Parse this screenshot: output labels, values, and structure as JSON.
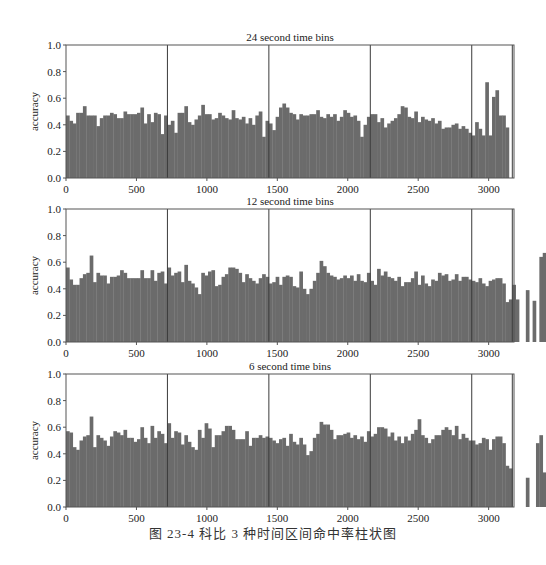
{
  "figure": {
    "caption": "图 23-4   科比 3 种时间区间命中率柱状图"
  },
  "style": {
    "bar_color": "#6b6b6b",
    "axis_color": "#555555",
    "vline_color": "#3a3a3a",
    "background": "#ffffff"
  },
  "chart_data": [
    {
      "type": "bar",
      "title": "24 second time bins",
      "xlabel": "",
      "ylabel": "accuracy",
      "xlim": [
        0,
        3180
      ],
      "ylim": [
        0.0,
        1.0
      ],
      "xticks": [
        0,
        500,
        1000,
        1500,
        2000,
        2500,
        3000
      ],
      "yticks": [
        0.0,
        0.2,
        0.4,
        0.6,
        0.8,
        1.0
      ],
      "ytick_labels": [
        "0.0",
        "0.2",
        "0.4",
        "0.6",
        "0.8",
        "1.0"
      ],
      "grid": false,
      "vertical_lines": [
        720,
        1440,
        2160,
        2880,
        3168
      ],
      "bin_width": 24,
      "values": [
        0.47,
        0.43,
        0.41,
        0.49,
        0.49,
        0.54,
        0.47,
        0.47,
        0.47,
        0.39,
        0.45,
        0.47,
        0.47,
        0.49,
        0.48,
        0.45,
        0.45,
        0.5,
        0.48,
        0.48,
        0.48,
        0.49,
        0.53,
        0.41,
        0.48,
        0.42,
        0.49,
        0.48,
        0.33,
        0.47,
        0.4,
        0.43,
        0.34,
        0.49,
        0.49,
        0.54,
        0.42,
        0.4,
        0.44,
        0.47,
        0.55,
        0.48,
        0.48,
        0.44,
        0.45,
        0.49,
        0.47,
        0.45,
        0.44,
        0.51,
        0.45,
        0.44,
        0.46,
        0.41,
        0.45,
        0.4,
        0.47,
        0.5,
        0.31,
        0.43,
        0.41,
        0.36,
        0.46,
        0.53,
        0.56,
        0.53,
        0.49,
        0.48,
        0.44,
        0.48,
        0.47,
        0.47,
        0.48,
        0.48,
        0.51,
        0.46,
        0.45,
        0.48,
        0.46,
        0.48,
        0.43,
        0.46,
        0.51,
        0.49,
        0.46,
        0.47,
        0.43,
        0.31,
        0.4,
        0.46,
        0.48,
        0.48,
        0.42,
        0.45,
        0.38,
        0.41,
        0.43,
        0.45,
        0.48,
        0.54,
        0.53,
        0.46,
        0.45,
        0.5,
        0.42,
        0.46,
        0.44,
        0.43,
        0.45,
        0.41,
        0.43,
        0.37,
        0.38,
        0.38,
        0.4,
        0.41,
        0.37,
        0.39,
        0.37,
        0.34,
        0.32,
        0.42,
        0.37,
        0.32,
        0.72,
        0.32,
        0.61,
        0.66,
        0.47,
        0.47,
        0.38
      ]
    },
    {
      "type": "bar",
      "title": "12 second time bins",
      "xlabel": "",
      "ylabel": "accuracy",
      "xlim": [
        0,
        3180
      ],
      "ylim": [
        0.0,
        1.0
      ],
      "xticks": [
        0,
        500,
        1000,
        1500,
        2000,
        2500,
        3000
      ],
      "yticks": [
        0.0,
        0.2,
        0.4,
        0.6,
        0.8,
        1.0
      ],
      "ytick_labels": [
        "0.0",
        "0.2",
        "0.4",
        "0.6",
        "0.8",
        "1.0"
      ],
      "grid": false,
      "vertical_lines": [
        720,
        1440,
        2160,
        2880,
        3168
      ],
      "bin_width": 24,
      "values": [
        0.56,
        0.47,
        0.43,
        0.43,
        0.48,
        0.51,
        0.52,
        0.65,
        0.45,
        0.52,
        0.5,
        0.5,
        0.44,
        0.49,
        0.49,
        0.5,
        0.54,
        0.52,
        0.48,
        0.48,
        0.48,
        0.48,
        0.54,
        0.48,
        0.48,
        0.54,
        0.46,
        0.52,
        0.53,
        0.44,
        0.56,
        0.5,
        0.52,
        0.53,
        0.45,
        0.58,
        0.46,
        0.44,
        0.41,
        0.36,
        0.52,
        0.5,
        0.53,
        0.54,
        0.42,
        0.43,
        0.49,
        0.51,
        0.56,
        0.56,
        0.55,
        0.52,
        0.45,
        0.51,
        0.48,
        0.46,
        0.44,
        0.48,
        0.51,
        0.49,
        0.44,
        0.45,
        0.49,
        0.43,
        0.49,
        0.5,
        0.49,
        0.42,
        0.41,
        0.53,
        0.4,
        0.36,
        0.4,
        0.46,
        0.52,
        0.61,
        0.57,
        0.52,
        0.5,
        0.49,
        0.47,
        0.48,
        0.5,
        0.48,
        0.5,
        0.46,
        0.51,
        0.46,
        0.45,
        0.52,
        0.46,
        0.43,
        0.55,
        0.5,
        0.53,
        0.49,
        0.48,
        0.46,
        0.49,
        0.42,
        0.45,
        0.45,
        0.48,
        0.53,
        0.43,
        0.5,
        0.44,
        0.42,
        0.47,
        0.46,
        0.52,
        0.5,
        0.51,
        0.46,
        0.47,
        0.51,
        0.46,
        0.49,
        0.49,
        0.47,
        0.46,
        0.45,
        0.48,
        0.44,
        0.42,
        0.46,
        0.47,
        0.48,
        0.48,
        0.44,
        0.3,
        0.32,
        0.43,
        0.32,
        0.0,
        0.0,
        0.39,
        0.0,
        0.31,
        0.0,
        0.64,
        0.67,
        0.62,
        0.55,
        0.37
      ]
    },
    {
      "type": "bar",
      "title": "6 second time bins",
      "xlabel": "",
      "ylabel": "accuracy",
      "xlim": [
        0,
        3180
      ],
      "ylim": [
        0.0,
        1.0
      ],
      "xticks": [
        0,
        500,
        1000,
        1500,
        2000,
        2500,
        3000
      ],
      "yticks": [
        0.0,
        0.2,
        0.4,
        0.6,
        0.8,
        1.0
      ],
      "ytick_labels": [
        "0.0",
        "0.2",
        "0.4",
        "0.6",
        "0.8",
        "1.0"
      ],
      "grid": false,
      "vertical_lines": [
        720,
        1440,
        2160,
        2880,
        3168
      ],
      "bin_width": 24,
      "values": [
        0.57,
        0.56,
        0.45,
        0.43,
        0.5,
        0.53,
        0.54,
        0.68,
        0.45,
        0.54,
        0.52,
        0.5,
        0.46,
        0.53,
        0.57,
        0.56,
        0.54,
        0.58,
        0.52,
        0.52,
        0.49,
        0.51,
        0.6,
        0.52,
        0.48,
        0.61,
        0.52,
        0.57,
        0.55,
        0.48,
        0.63,
        0.52,
        0.57,
        0.56,
        0.47,
        0.54,
        0.49,
        0.45,
        0.43,
        0.58,
        0.52,
        0.63,
        0.59,
        0.45,
        0.54,
        0.54,
        0.57,
        0.61,
        0.61,
        0.58,
        0.51,
        0.51,
        0.51,
        0.57,
        0.46,
        0.52,
        0.52,
        0.54,
        0.52,
        0.53,
        0.52,
        0.5,
        0.48,
        0.51,
        0.52,
        0.46,
        0.55,
        0.49,
        0.47,
        0.52,
        0.47,
        0.39,
        0.42,
        0.52,
        0.55,
        0.64,
        0.62,
        0.62,
        0.58,
        0.51,
        0.54,
        0.54,
        0.55,
        0.56,
        0.52,
        0.54,
        0.51,
        0.53,
        0.49,
        0.57,
        0.53,
        0.55,
        0.6,
        0.6,
        0.59,
        0.53,
        0.56,
        0.5,
        0.53,
        0.48,
        0.53,
        0.5,
        0.55,
        0.58,
        0.66,
        0.54,
        0.52,
        0.48,
        0.51,
        0.54,
        0.54,
        0.58,
        0.6,
        0.58,
        0.54,
        0.61,
        0.51,
        0.55,
        0.52,
        0.5,
        0.5,
        0.47,
        0.48,
        0.52,
        0.51,
        0.43,
        0.51,
        0.53,
        0.53,
        0.48,
        0.31,
        0.29,
        0.0,
        0.0,
        0.0,
        0.0,
        0.22,
        0.0,
        0.0,
        0.48,
        0.54,
        0.26
      ]
    }
  ]
}
